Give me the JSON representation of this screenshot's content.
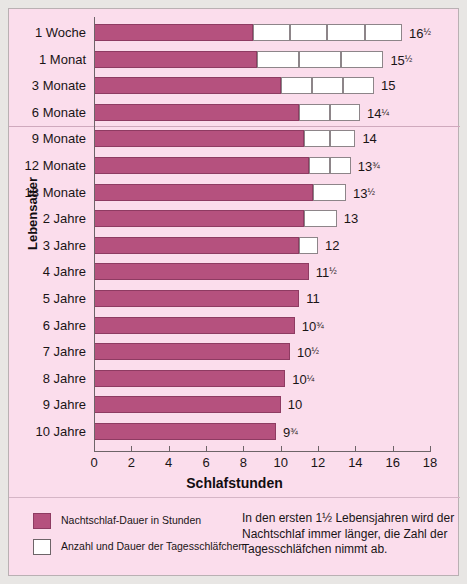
{
  "axes": {
    "x_title": "Schlafstunden",
    "y_title": "Lebensalter",
    "x_ticks": [
      "0",
      "2",
      "4",
      "6",
      "8",
      "10",
      "12",
      "14",
      "16",
      "18"
    ]
  },
  "legend": {
    "night_label": "Nachtschlaf-Dauer in Stunden",
    "nap_label": "Anzahl und Dauer der Tagesschläfchen"
  },
  "caption": "In den ersten 1½ Lebensjahren wird der Nachtschlaf immer länger, die Zahl der Tagesschläfchen nimmt ab.",
  "colors": {
    "night": "#b5517e",
    "nap": "#ffffff",
    "background": "#fbddec",
    "axis": "#6d6468"
  },
  "chart_data": {
    "type": "bar",
    "orientation": "horizontal",
    "stacked": true,
    "title": "",
    "xlabel": "Schlafstunden",
    "ylabel": "Lebensalter",
    "xlim": [
      0,
      18
    ],
    "grid": false,
    "legend_position": "bottom-left",
    "categories": [
      "1 Woche",
      "1 Monat",
      "3 Monate",
      "6 Monate",
      "9 Monate",
      "12 Monate",
      "18 Monate",
      "2 Jahre",
      "3 Jahre",
      "4 Jahre",
      "5 Jahre",
      "6 Jahre",
      "7 Jahre",
      "8 Jahre",
      "9 Jahre",
      "10 Jahre"
    ],
    "series": [
      {
        "name": "Nachtschlaf-Dauer in Stunden",
        "values": [
          8.5,
          8.75,
          10.0,
          11.0,
          11.25,
          11.5,
          11.75,
          11.25,
          11.0,
          11.5,
          11.0,
          10.75,
          10.5,
          10.25,
          10.0,
          9.75
        ]
      },
      {
        "name": "Anzahl und Dauer der Tagesschläfchen",
        "values": [
          8.0,
          6.75,
          5.0,
          3.25,
          2.75,
          2.25,
          1.75,
          1.75,
          1.0,
          0,
          0,
          0,
          0,
          0,
          0,
          0
        ]
      }
    ],
    "nap_counts": [
      4,
      3,
      3,
      2,
      2,
      2,
      1,
      1,
      1,
      0,
      0,
      0,
      0,
      0,
      0,
      0
    ],
    "totals": [
      16.5,
      15.5,
      15,
      14.25,
      14,
      13.75,
      13.5,
      13,
      12,
      11.5,
      11,
      10.75,
      10.5,
      10.25,
      10,
      9.75
    ],
    "total_labels": [
      {
        "whole": "16",
        "frac": "½"
      },
      {
        "whole": "15",
        "frac": "½"
      },
      {
        "whole": "15",
        "frac": ""
      },
      {
        "whole": "14",
        "frac": "¼"
      },
      {
        "whole": "14",
        "frac": ""
      },
      {
        "whole": "13",
        "frac": "¾"
      },
      {
        "whole": "13",
        "frac": "½"
      },
      {
        "whole": "13",
        "frac": ""
      },
      {
        "whole": "12",
        "frac": ""
      },
      {
        "whole": "11",
        "frac": "½"
      },
      {
        "whole": "11",
        "frac": ""
      },
      {
        "whole": "10",
        "frac": "¾"
      },
      {
        "whole": "10",
        "frac": "½"
      },
      {
        "whole": "10",
        "frac": "¼"
      },
      {
        "whole": "10",
        "frac": ""
      },
      {
        "whole": "9",
        "frac": "¾"
      }
    ],
    "group_divider_after_index": 3
  }
}
